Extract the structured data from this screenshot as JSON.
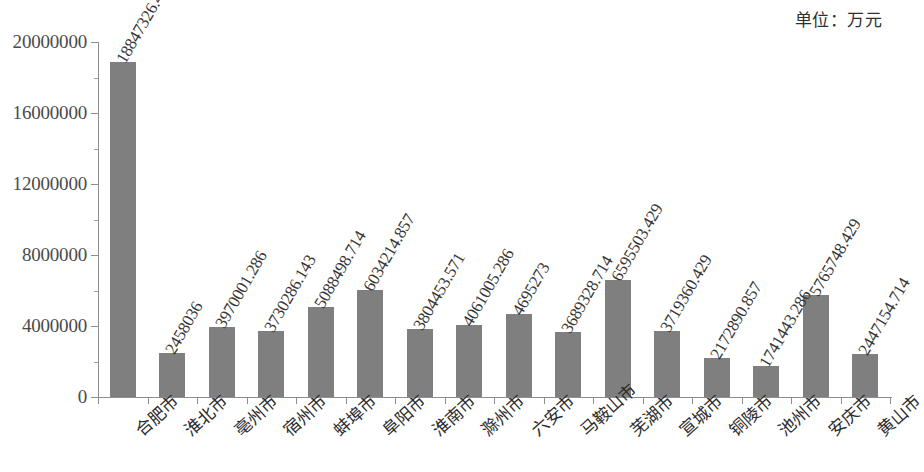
{
  "unit_note": "单位：万元",
  "chart_data": {
    "type": "bar",
    "title": "",
    "subtitle": "",
    "xlabel": "",
    "ylabel": "",
    "unit_note": "单位：万元",
    "ylim": [
      0,
      20000000
    ],
    "yticks": [
      0,
      4000000,
      8000000,
      12000000,
      16000000,
      20000000
    ],
    "ytick_labels": [
      "0",
      "4000000",
      "8000000",
      "12000000",
      "16000000",
      "20000000"
    ],
    "grid": false,
    "legend": null,
    "bar_color": "#7f7f7f",
    "categories": [
      "合肥市",
      "淮北市",
      "亳州市",
      "宿州市",
      "蚌埠市",
      "阜阳市",
      "淮南市",
      "滁州市",
      "六安市",
      "马鞍山市",
      "芜湖市",
      "宣城市",
      "铜陵市",
      "池州市",
      "安庆市",
      "黄山市"
    ],
    "values": [
      18847326.43,
      2458036,
      3970001.286,
      3730286.143,
      5088498.714,
      6034214.857,
      3804453.571,
      4061005.286,
      4695273,
      3689328.714,
      6595503.429,
      3719360.429,
      2172890.857,
      1741443.286,
      5765748.429,
      2447154.714
    ],
    "value_labels": [
      "18847326.43",
      "2458036",
      "3970001.286",
      "3730286.143",
      "5088498.714",
      "6034214.857",
      "3804453.571",
      "4061005.286",
      "4695273",
      "3689328.714",
      "6595503.429",
      "3719360.429",
      "2172890.857",
      "1741443.286",
      "5765748.429",
      "2447154.714"
    ]
  }
}
